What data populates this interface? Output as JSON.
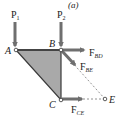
{
  "figure": {
    "panel_label": "(a)",
    "colors": {
      "member_fill": "#a9a9a9",
      "member_edge": "#3a3a3a",
      "arrow": "#6f6f6f",
      "text": "#222222",
      "dashed": "#777777"
    },
    "loads": [
      {
        "id": "P1",
        "label": "P",
        "subscript": "1",
        "at_joint": "A",
        "direction": "down"
      },
      {
        "id": "P2",
        "label": "P",
        "subscript": "2",
        "at_joint": "B",
        "direction": "down"
      }
    ],
    "joints": [
      {
        "id": "A",
        "label": "A"
      },
      {
        "id": "B",
        "label": "B"
      },
      {
        "id": "C",
        "label": "C"
      },
      {
        "id": "E",
        "label": "E"
      }
    ],
    "member_forces": [
      {
        "id": "F_BD",
        "label": "F",
        "subscript": "BD",
        "from_joint": "B",
        "direction": "right"
      },
      {
        "id": "F_BE",
        "label": "F",
        "subscript": "BE",
        "from_joint": "B",
        "direction": "toward E"
      },
      {
        "id": "F_CE",
        "label": "F",
        "subscript": "CE",
        "from_joint": "C",
        "direction": "right"
      }
    ],
    "body": "triangle ABC (free body)"
  }
}
